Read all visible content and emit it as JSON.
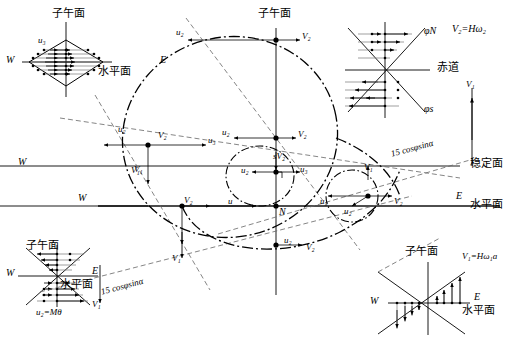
{
  "figure": {
    "type": "technical-vector-diagram",
    "colors": {
      "stroke": "#000000",
      "background": "#ffffff",
      "thin": "#555555"
    }
  },
  "terms": {
    "meridian_plane": "子午面",
    "horizontal_plane": "水平面",
    "stable_plane": "稳定面",
    "equator": "赤道",
    "west": "W",
    "east": "E",
    "north": "N",
    "phi_n": "φN",
    "phi_s": "φs",
    "cos_sin_label": "15 cosφsinα",
    "v2_formula": "V₂=Hω₂",
    "v1_formula": "V₁=Hω₁a",
    "u2_formula": "u₂=Mθ",
    "u": "u",
    "u2": "u₂",
    "u3": "u₃",
    "v1": "V₁",
    "v2": "V₂",
    "sv2": "sV₂"
  },
  "panels": {
    "top_left": {
      "name": "diamond-u3-panel",
      "title": "子午面",
      "plane_label": "水平面",
      "west": "W",
      "east": "E",
      "vector": "u₃",
      "shape": "diamond",
      "arrow_direction": "right",
      "rows": 7
    },
    "top_right": {
      "name": "equator-x-panel",
      "upper_branch": "φN",
      "lower_branch": "φs",
      "axis_label": "赤道",
      "formula": "V₂=Hω₂",
      "upper_arrow_direction": "right",
      "lower_arrow_direction": "left",
      "rows": 8
    },
    "bottom_left": {
      "name": "bowtie-u2-panel",
      "title": "子午面",
      "plane_label": "水平面",
      "west": "W",
      "east": "E",
      "formula": "u₂=Mθ",
      "upper_arrow_direction": "left",
      "lower_arrow_direction": "right",
      "rows": 8
    },
    "bottom_right": {
      "name": "bowtie-v1-panel",
      "title": "子午面",
      "plane_label": "水平面",
      "west": "W",
      "east": "E",
      "formula": "V₁=Hω₁a",
      "left_arrow_direction": "down",
      "right_arrow_direction": "up",
      "columns": 8
    }
  },
  "central": {
    "name": "main-ellipse-diagram",
    "meridian_top": "子午面",
    "center_node": "N",
    "stable_plane": "稳定面",
    "horizontal_plane": "水平面",
    "east": "E",
    "west": "W",
    "slanted_label_right": "15 cosφsinα",
    "slanted_label_left": "15 cosφsinα",
    "nodes": [
      {
        "id": "top",
        "labels": [
          "u₂",
          "V₂"
        ]
      },
      {
        "id": "left",
        "labels": [
          "u₂",
          "V₂",
          "u₃",
          "V₁"
        ]
      },
      {
        "id": "inner-top",
        "labels": [
          "u₂",
          "V₂"
        ]
      },
      {
        "id": "inner-center",
        "labels": [
          "u₂",
          "sV₂",
          "u₃"
        ]
      },
      {
        "id": "right",
        "labels": [
          "u₃",
          "u₂",
          "V₂",
          "V₁"
        ]
      },
      {
        "id": "bottom-left",
        "labels": [
          "V₂",
          "V₁"
        ]
      },
      {
        "id": "center-n",
        "labels": [
          "N",
          "u"
        ]
      },
      {
        "id": "bottom",
        "labels": [
          "u₂",
          "V₂"
        ]
      }
    ],
    "free_vectors": [
      {
        "label": "V₁",
        "direction": "up",
        "location": "far-right"
      },
      {
        "label": "V₁",
        "direction": "down",
        "location": "bottom-left-outer"
      },
      {
        "label": "V₁",
        "direction": "down",
        "location": "bottom-left-inner"
      }
    ]
  }
}
